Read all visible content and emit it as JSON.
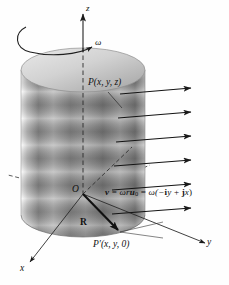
{
  "figure": {
    "background_color": "#fefefe",
    "ink_color": "#1a1a1a"
  },
  "axes": {
    "z_label": "z",
    "x_label": "x",
    "y_label": "y",
    "origin_label": "O"
  },
  "rotation": {
    "omega_label": "ω",
    "arc_name": "rotation-arc"
  },
  "points": {
    "p_label": "P(x, y, z)",
    "p_prime_label": "P′(x, y, 0)",
    "radius_vector_label": "R"
  },
  "equation": {
    "text": "v = ωru₀ = ω(−iy + jx)",
    "lhs": "v",
    "eq1": "=",
    "mid": "ωr",
    "u": "u",
    "u_sub": "0",
    "eq2": "=",
    "rhs_open": "ω(−",
    "i": "i",
    "y": "y",
    "plus": "+",
    "j": "j",
    "x": "x",
    "rhs_close": ")"
  },
  "velocity_arrows": {
    "count": 6,
    "name": "velocity-vector",
    "y_positions": [
      94,
      117,
      141,
      165,
      189,
      213
    ],
    "x_start": 120,
    "x_end": 191
  },
  "cylinder": {
    "name": "rotating-cylinder",
    "center_x": 83,
    "top_center_y": 70,
    "bottom_center_y": 215,
    "radius_x": 62,
    "radius_y": 22,
    "band_count": 5
  }
}
